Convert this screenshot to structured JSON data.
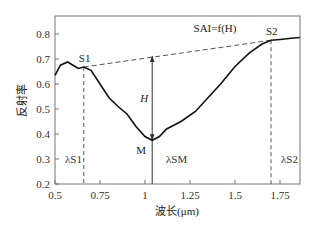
{
  "chart_data": {
    "type": "line",
    "title": "",
    "xlabel": "波长(μm)",
    "ylabel": "反射率",
    "xlim": [
      0.5,
      1.86
    ],
    "ylim": [
      0.2,
      0.87
    ],
    "xticks": [
      "0.5",
      "0.75",
      "1",
      "1.25",
      "1.5",
      "1.75"
    ],
    "yticks": [
      "0.2",
      "0.3",
      "0.4",
      "0.5",
      "0.6",
      "0.7",
      "0.8"
    ],
    "grid": false,
    "series": [
      {
        "name": "reflectance",
        "x": [
          0.5,
          0.53,
          0.57,
          0.6,
          0.63,
          0.66,
          0.7,
          0.75,
          0.8,
          0.85,
          0.9,
          0.95,
          1.0,
          1.04,
          1.08,
          1.12,
          1.2,
          1.28,
          1.35,
          1.42,
          1.5,
          1.58,
          1.65,
          1.7,
          1.75,
          1.8,
          1.86
        ],
        "y": [
          0.635,
          0.675,
          0.688,
          0.675,
          0.662,
          0.668,
          0.655,
          0.6,
          0.545,
          0.51,
          0.48,
          0.43,
          0.39,
          0.375,
          0.39,
          0.42,
          0.45,
          0.49,
          0.545,
          0.6,
          0.67,
          0.725,
          0.76,
          0.775,
          0.778,
          0.782,
          0.786
        ]
      }
    ],
    "annotations": {
      "formula": "SAI=f(H)",
      "S1": {
        "label": "S1",
        "x": 0.66,
        "y": 0.668
      },
      "S2": {
        "label": "S2",
        "x": 1.7,
        "y": 0.775
      },
      "M": {
        "label": "M",
        "x": 1.04,
        "y": 0.375
      },
      "H": {
        "label": "H",
        "x": 1.04,
        "y_from": 0.375,
        "y_to": 0.712
      },
      "lambda_S1": "λS1",
      "lambda_SM": "λSM",
      "lambda_S2": "λS2"
    }
  }
}
